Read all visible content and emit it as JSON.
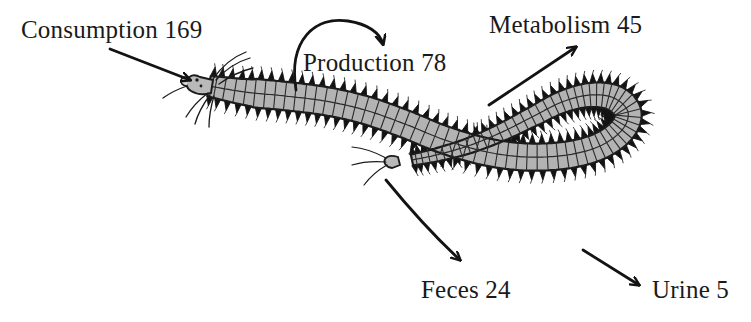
{
  "figure": {
    "background_color": "#ffffff",
    "ink_color": "#1a1a1a",
    "body_fill_color": "#b0b0b0",
    "width": 751,
    "height": 322
  },
  "labels": {
    "consumption": "Consumption 169",
    "production": "Production 78",
    "metabolism": "Metabolism 45",
    "feces": "Feces 24",
    "urine": "Urine 5"
  },
  "chart_data": {
    "type": "diagram",
    "categories": [
      "Consumption",
      "Production",
      "Metabolism",
      "Feces",
      "Urine"
    ],
    "values": [
      169,
      78,
      45,
      24,
      5
    ],
    "units": "energy units",
    "annotations": [
      {
        "name": "Consumption",
        "value": 169,
        "direction": "in",
        "arrow": "straight",
        "points_to": "worm-head"
      },
      {
        "name": "Production",
        "value": 78,
        "direction": "internal",
        "arrow": "curved-loop",
        "points_to": "worm-body"
      },
      {
        "name": "Metabolism",
        "value": 45,
        "direction": "out",
        "arrow": "straight",
        "points_to": "upper-right"
      },
      {
        "name": "Feces",
        "value": 24,
        "direction": "out",
        "arrow": "curved",
        "points_to": "lower-left"
      },
      {
        "name": "Urine",
        "value": 5,
        "direction": "out",
        "arrow": "straight",
        "points_to": "lower-right"
      }
    ]
  },
  "arrows": {
    "consumption": {
      "label": "consumption-arrow",
      "style": "straight"
    },
    "production": {
      "label": "production-arrow",
      "style": "curved-arc"
    },
    "metabolism": {
      "label": "metabolism-arrow",
      "style": "straight"
    },
    "feces": {
      "label": "feces-arrow",
      "style": "curved"
    },
    "urine": {
      "label": "urine-arrow",
      "style": "straight"
    }
  }
}
